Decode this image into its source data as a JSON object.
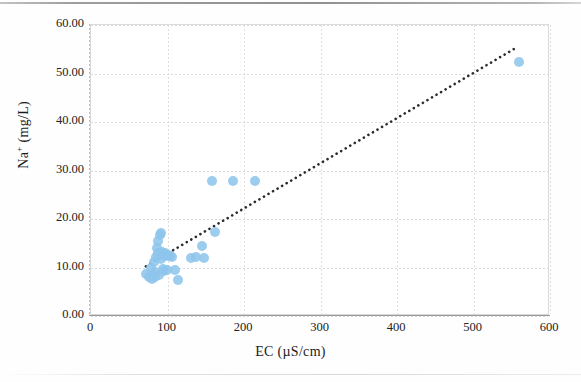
{
  "chart_data": {
    "type": "scatter",
    "title": "",
    "xlabel": "EC (µS/cm)",
    "ylabel": "Na⁺ (mg/L)",
    "ylabel_base": "Na",
    "ylabel_sup": "+",
    "ylabel_unit": " (mg/L)",
    "xlim": [
      0,
      600
    ],
    "ylim": [
      0,
      60
    ],
    "xticks": [
      0,
      100,
      200,
      300,
      400,
      500,
      600
    ],
    "xtick_labels": [
      "0",
      "100",
      "200",
      "300",
      "400",
      "500",
      "600"
    ],
    "yticks": [
      0,
      10,
      20,
      30,
      40,
      50,
      60
    ],
    "ytick_labels": [
      "0.00",
      "10.00",
      "20.00",
      "30.00",
      "40.00",
      "50.00",
      "60.00"
    ],
    "grid": true,
    "grid_style": "dotted",
    "legend": false,
    "marker_color": "#8ec5ec",
    "marker_shape": "circle",
    "marker_size": 10,
    "trendline": {
      "style": "dotted",
      "color": "#2b2b2b",
      "x_start": 72,
      "y_start": 9.9,
      "x_end": 555,
      "y_end": 55.0
    },
    "series": [
      {
        "name": "Na⁺ vs EC",
        "points": [
          [
            72,
            8.6
          ],
          [
            76,
            8.0
          ],
          [
            78,
            10.0
          ],
          [
            79,
            8.2
          ],
          [
            80,
            7.6
          ],
          [
            82,
            11.2
          ],
          [
            83,
            8.0
          ],
          [
            84,
            9.0
          ],
          [
            85,
            12.2
          ],
          [
            86,
            14.0
          ],
          [
            87,
            15.4
          ],
          [
            88,
            13.0
          ],
          [
            89,
            8.4
          ],
          [
            90,
            16.8
          ],
          [
            91,
            17.2
          ],
          [
            92,
            11.8
          ],
          [
            93,
            13.2
          ],
          [
            94,
            9.6
          ],
          [
            95,
            12.6
          ],
          [
            96,
            9.2
          ],
          [
            97,
            13.0
          ],
          [
            98,
            12.4
          ],
          [
            99,
            9.4
          ],
          [
            100,
            12.6
          ],
          [
            103,
            12.4
          ],
          [
            106,
            12.2
          ],
          [
            110,
            9.4
          ],
          [
            114,
            7.4
          ],
          [
            131,
            12.0
          ],
          [
            137,
            12.2
          ],
          [
            145,
            14.4
          ],
          [
            148,
            12.0
          ],
          [
            158,
            27.8
          ],
          [
            162,
            17.4
          ],
          [
            186,
            27.9
          ],
          [
            214,
            27.8
          ],
          [
            560,
            52.4
          ]
        ]
      }
    ]
  }
}
